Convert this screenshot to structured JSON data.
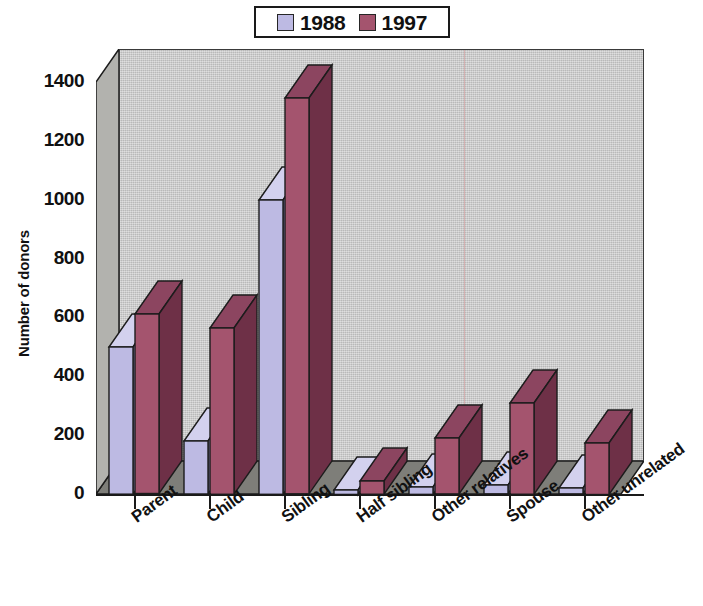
{
  "legend": {
    "items": [
      {
        "label": "1988",
        "color": "#bdbae3"
      },
      {
        "label": "1997",
        "color": "#a4546e"
      }
    ]
  },
  "axes": {
    "ylabel": "Number of donors",
    "yticks": [
      "0",
      "200",
      "400",
      "600",
      "800",
      "1000",
      "1200",
      "1400"
    ],
    "xticklabels": [
      "Parent",
      "Child",
      "Sibling",
      "Half sibling",
      "Other relatives",
      "Spouse",
      "Other unrelated"
    ]
  },
  "colors": {
    "series_1988_front": "#bdbae3",
    "series_1988_side": "#8f8cc0",
    "series_1988_top": "#d3d1ee",
    "series_1997_front": "#a4546e",
    "series_1997_side": "#6e3047",
    "series_1997_top": "#8c4560",
    "plot_background": "#c9c9c9",
    "floor": "#7e7e79",
    "outline": "#1c1c1c"
  },
  "chart_data": {
    "type": "bar",
    "title": "",
    "subtitle": "",
    "xlabel": "",
    "ylabel": "Number of donors",
    "categories": [
      "Parent",
      "Child",
      "Sibling",
      "Half sibling",
      "Other relatives",
      "Spouse",
      "Other unrelated"
    ],
    "series": [
      {
        "name": "1988",
        "values": [
          500,
          180,
          1000,
          15,
          25,
          30,
          20
        ]
      },
      {
        "name": "1997",
        "values": [
          610,
          565,
          1345,
          45,
          190,
          310,
          175
        ]
      }
    ],
    "ylim": [
      0,
      1400
    ],
    "ytick_step": 200,
    "grid": false,
    "legend_position": "top-center",
    "style": "3d-grouped-bar"
  }
}
